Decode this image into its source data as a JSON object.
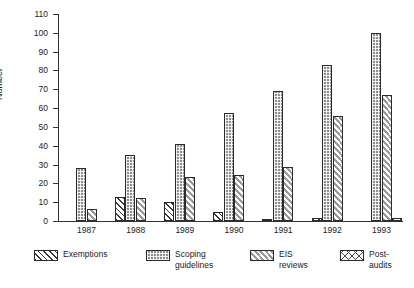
{
  "chart_data": {
    "type": "bar",
    "title": "",
    "xlabel": "",
    "ylabel": "Number",
    "ylim": [
      0,
      110
    ],
    "ytick_step": 10,
    "yticks": [
      "110",
      "100",
      "90",
      "80",
      "70",
      "60",
      "50",
      "40",
      "30",
      "20",
      "10",
      "0"
    ],
    "grid": false,
    "legend_position": "bottom",
    "categories": [
      "1987",
      "1988",
      "1989",
      "1990",
      "1991",
      "1992",
      "1993"
    ],
    "series": [
      {
        "name": "Exemptions",
        "pattern": "diagonal-hatch",
        "values": [
          0,
          13,
          10,
          5,
          1,
          1.5,
          0
        ]
      },
      {
        "name": "Scoping\nguidelines",
        "pattern": "dense-checker",
        "values": [
          28,
          35,
          41,
          57.5,
          69,
          83,
          100
        ]
      },
      {
        "name": "EIS\nreviews",
        "pattern": "light-diagonal-hatch",
        "values": [
          6.5,
          12,
          23.5,
          24.5,
          28.5,
          56,
          67
        ]
      },
      {
        "name": "Post-audits",
        "pattern": "cross-hatch",
        "values": [
          0,
          0,
          0,
          0,
          0,
          0,
          1.5
        ]
      }
    ]
  },
  "legend": {
    "items": [
      {
        "label": "Exemptions"
      },
      {
        "label": "Scoping\nguidelines"
      },
      {
        "label": "EIS\nreviews"
      },
      {
        "label": "Post-audits"
      }
    ]
  },
  "colors": {
    "axis": "#333333",
    "text": "#1b1b1b",
    "background": "#ffffff",
    "scoping_fill": "#8f8f8f",
    "eis_fill": "#9a9a9a",
    "hatch_line": "#3a3a3a"
  }
}
